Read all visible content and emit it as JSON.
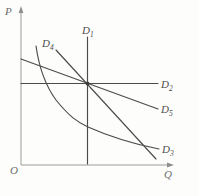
{
  "figure": {
    "type": "economics-demand-elasticity-diagram",
    "axes": {
      "vertical_label": "P",
      "horizontal_label": "Q",
      "origin_label": "O"
    },
    "curves": [
      {
        "id": "D1",
        "label_base": "D",
        "label_sub": "1",
        "shape": "vertical-line",
        "meaning": "perfectly inelastic demand"
      },
      {
        "id": "D2",
        "label_base": "D",
        "label_sub": "2",
        "shape": "horizontal-line",
        "meaning": "perfectly elastic demand"
      },
      {
        "id": "D3",
        "label_base": "D",
        "label_sub": "3",
        "shape": "convex-hyperbola-curve",
        "meaning": "unit elastic demand"
      },
      {
        "id": "D4",
        "label_base": "D",
        "label_sub": "4",
        "shape": "steep-straight-line",
        "meaning": "inelastic demand line"
      },
      {
        "id": "D5",
        "label_base": "D",
        "label_sub": "5",
        "shape": "flat-straight-line",
        "meaning": "elastic demand line"
      }
    ],
    "annotations": {
      "common_intersection_dot": true
    },
    "colors": {
      "curve": "#4b4b4b",
      "axis": "#9b9b9b",
      "label": "#4d4d4d",
      "background": "#fdfdfb"
    }
  }
}
